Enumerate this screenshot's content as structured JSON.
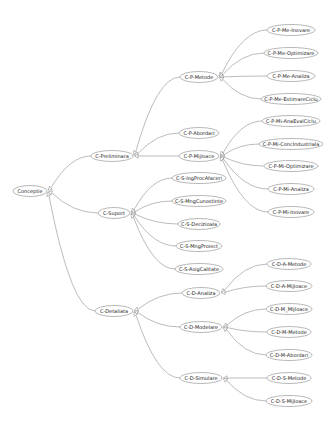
{
  "diagram": {
    "type": "generalization-tree",
    "root": "Conceptie",
    "nodes": [
      {
        "id": "conceptie",
        "label": "Conceptie",
        "x": 30,
        "y": 191,
        "w": 34
      },
      {
        "id": "c-preliminara",
        "label": "C-Preliminara",
        "x": 112,
        "y": 156,
        "w": 42
      },
      {
        "id": "c-suport",
        "label": "C-Suport",
        "x": 114,
        "y": 213,
        "w": 32
      },
      {
        "id": "c-detaliata",
        "label": "C-Detaliata",
        "x": 114,
        "y": 311,
        "w": 38
      },
      {
        "id": "c-p-metode",
        "label": "C-P-Metode",
        "x": 199,
        "y": 77,
        "w": 38
      },
      {
        "id": "c-p-abordari",
        "label": "C-P-Abordari",
        "x": 199,
        "y": 133,
        "w": 40
      },
      {
        "id": "c-p-mijloace",
        "label": "C-P-Mijloace",
        "x": 199,
        "y": 156,
        "w": 40
      },
      {
        "id": "c-p-me-inovare",
        "label": "C-P-Me-Inovare",
        "x": 291,
        "y": 30,
        "w": 48
      },
      {
        "id": "c-p-me-optimizare",
        "label": "C-P-Me-Optimizare",
        "x": 291,
        "y": 53,
        "w": 54
      },
      {
        "id": "c-p-me-analiza",
        "label": "C-P-Me-Analiza",
        "x": 291,
        "y": 76,
        "w": 48
      },
      {
        "id": "c-p-me-estimareciclu",
        "label": "C-P-Me-EstimareCiclu",
        "x": 291,
        "y": 99,
        "w": 60
      },
      {
        "id": "c-p-mi-anaevalciclu",
        "label": "C-P-Mi-AnaEvalCiclu",
        "x": 291,
        "y": 121,
        "w": 58
      },
      {
        "id": "c-p-mi-concindustriala",
        "label": "C-P-Mi-ConcIndustriala",
        "x": 291,
        "y": 144,
        "w": 64
      },
      {
        "id": "c-p-mi-optimizare",
        "label": "C-P-Mi-Optimizare",
        "x": 291,
        "y": 166,
        "w": 54
      },
      {
        "id": "c-p-mi-analiza",
        "label": "C-P-Mi-Analiza",
        "x": 291,
        "y": 189,
        "w": 46
      },
      {
        "id": "c-p-mi-inovare",
        "label": "C-P-Mi-Inovare",
        "x": 291,
        "y": 212,
        "w": 46
      },
      {
        "id": "c-s-ingprocafaceri",
        "label": "C-S-IngProcAfaceri",
        "x": 199,
        "y": 178,
        "w": 54
      },
      {
        "id": "c-s-mngcunostinte",
        "label": "C-S-MngCunostinte",
        "x": 199,
        "y": 201,
        "w": 54
      },
      {
        "id": "c-s-decizionala",
        "label": "C-S-Decizioala",
        "x": 199,
        "y": 224,
        "w": 42
      },
      {
        "id": "c-s-mngproiect",
        "label": "C-S-MngProiect",
        "x": 199,
        "y": 246,
        "w": 46
      },
      {
        "id": "c-s-asigcalitate",
        "label": "C-S-AsigCalitate",
        "x": 199,
        "y": 269,
        "w": 48
      },
      {
        "id": "c-d-analiza",
        "label": "C-D-Analiza",
        "x": 201,
        "y": 293,
        "w": 38
      },
      {
        "id": "c-d-modelare",
        "label": "C-D-Modelare",
        "x": 201,
        "y": 327,
        "w": 42
      },
      {
        "id": "c-d-simulare",
        "label": "C-D-Simulare",
        "x": 201,
        "y": 378,
        "w": 42
      },
      {
        "id": "c-d-a-metode",
        "label": "C-D-A-Metode",
        "x": 289,
        "y": 264,
        "w": 44
      },
      {
        "id": "c-d-a-mijloace",
        "label": "C-D-A-Mijloace",
        "x": 289,
        "y": 286,
        "w": 46
      },
      {
        "id": "c-d-m-mijloace",
        "label": "C-D-M_Mijloace",
        "x": 289,
        "y": 309,
        "w": 46
      },
      {
        "id": "c-d-m-metode",
        "label": "C-D-M-Metode",
        "x": 289,
        "y": 332,
        "w": 44
      },
      {
        "id": "c-d-m-abordari",
        "label": "C-D-M-Abordari",
        "x": 289,
        "y": 355,
        "w": 46
      },
      {
        "id": "c-d-s-metode",
        "label": "C-D-S-Metode",
        "x": 289,
        "y": 378,
        "w": 44
      },
      {
        "id": "c-d-s-mijloace",
        "label": "C-D-S-Mijloace",
        "x": 289,
        "y": 401,
        "w": 46
      }
    ],
    "edges": [
      {
        "from": "c-preliminara",
        "to": "conceptie"
      },
      {
        "from": "c-suport",
        "to": "conceptie"
      },
      {
        "from": "c-detaliata",
        "to": "conceptie"
      },
      {
        "from": "c-p-metode",
        "to": "c-preliminara"
      },
      {
        "from": "c-p-abordari",
        "to": "c-preliminara"
      },
      {
        "from": "c-p-mijloace",
        "to": "c-preliminara"
      },
      {
        "from": "c-p-me-inovare",
        "to": "c-p-metode"
      },
      {
        "from": "c-p-me-optimizare",
        "to": "c-p-metode"
      },
      {
        "from": "c-p-me-analiza",
        "to": "c-p-metode"
      },
      {
        "from": "c-p-me-estimareciclu",
        "to": "c-p-metode"
      },
      {
        "from": "c-p-mi-anaevalciclu",
        "to": "c-p-mijloace"
      },
      {
        "from": "c-p-mi-concindustriala",
        "to": "c-p-mijloace"
      },
      {
        "from": "c-p-mi-optimizare",
        "to": "c-p-mijloace"
      },
      {
        "from": "c-p-mi-analiza",
        "to": "c-p-mijloace"
      },
      {
        "from": "c-p-mi-inovare",
        "to": "c-p-mijloace"
      },
      {
        "from": "c-s-ingprocafaceri",
        "to": "c-suport"
      },
      {
        "from": "c-s-mngcunostinte",
        "to": "c-suport"
      },
      {
        "from": "c-s-decizionala",
        "to": "c-suport"
      },
      {
        "from": "c-s-mngproiect",
        "to": "c-suport"
      },
      {
        "from": "c-s-asigcalitate",
        "to": "c-suport"
      },
      {
        "from": "c-d-analiza",
        "to": "c-detaliata"
      },
      {
        "from": "c-d-modelare",
        "to": "c-detaliata"
      },
      {
        "from": "c-d-simulare",
        "to": "c-detaliata"
      },
      {
        "from": "c-d-a-metode",
        "to": "c-d-analiza"
      },
      {
        "from": "c-d-a-mijloace",
        "to": "c-d-analiza"
      },
      {
        "from": "c-d-m-mijloace",
        "to": "c-d-modelare"
      },
      {
        "from": "c-d-m-metode",
        "to": "c-d-modelare"
      },
      {
        "from": "c-d-m-abordari",
        "to": "c-d-modelare"
      },
      {
        "from": "c-d-s-metode",
        "to": "c-d-simulare"
      },
      {
        "from": "c-d-s-mijloace",
        "to": "c-d-simulare"
      }
    ],
    "colors": {
      "background": "#ffffff",
      "node_fill": "#ffffff",
      "node_stroke": "#9a9a9a",
      "edge": "#8e8e8e",
      "text": "#222222"
    }
  }
}
